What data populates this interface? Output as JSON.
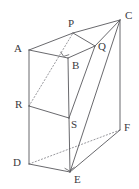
{
  "figure": {
    "type": "geometry-diagram",
    "background_color": "#ffffff",
    "line_color": "#58585c",
    "hidden_line_color": "#8d8d92",
    "label_color": "#3a3a3e",
    "vertices": [
      {
        "id": "A",
        "label": "A",
        "x": 29,
        "y": 50,
        "label_x": 14,
        "label_y": 43
      },
      {
        "id": "P",
        "label": "P",
        "x": 73,
        "y": 33,
        "label_x": 68,
        "label_y": 18
      },
      {
        "id": "C",
        "label": "C",
        "x": 120,
        "y": 20,
        "label_x": 125,
        "label_y": 10
      },
      {
        "id": "Q",
        "label": "Q",
        "x": 95,
        "y": 46,
        "label_x": 98,
        "label_y": 41
      },
      {
        "id": "B",
        "label": "B",
        "x": 68,
        "y": 58,
        "label_x": 72,
        "label_y": 60
      },
      {
        "id": "R",
        "label": "R",
        "x": 29,
        "y": 106,
        "label_x": 15,
        "label_y": 99
      },
      {
        "id": "S",
        "label": "S",
        "x": 69,
        "y": 118,
        "label_x": 71,
        "label_y": 119
      },
      {
        "id": "F",
        "label": "F",
        "x": 120,
        "y": 130,
        "label_x": 124,
        "label_y": 122
      },
      {
        "id": "D",
        "label": "D",
        "x": 29,
        "y": 164,
        "label_x": 13,
        "label_y": 157
      },
      {
        "id": "E",
        "label": "E",
        "x": 70,
        "y": 172,
        "label_x": 74,
        "label_y": 174
      }
    ],
    "solid_edges": [
      {
        "name": "edge-A-P",
        "from": "A",
        "to": "P"
      },
      {
        "name": "edge-P-C",
        "from": "P",
        "to": "C"
      },
      {
        "name": "edge-C-Q",
        "from": "C",
        "to": "Q"
      },
      {
        "name": "edge-P-Q",
        "from": "P",
        "to": "Q"
      },
      {
        "name": "edge-A-B",
        "from": "A",
        "to": "B"
      },
      {
        "name": "edge-Q-B",
        "from": "Q",
        "to": "B"
      },
      {
        "name": "edge-Q-S",
        "from": "Q",
        "to": "S"
      },
      {
        "name": "edge-C-E",
        "from": "C",
        "to": "E"
      },
      {
        "name": "edge-C-F",
        "from": "C",
        "to": "F"
      },
      {
        "name": "edge-A-R",
        "from": "A",
        "to": "R"
      },
      {
        "name": "edge-R-D",
        "from": "R",
        "to": "D"
      },
      {
        "name": "edge-B-S",
        "from": "B",
        "to": "S"
      },
      {
        "name": "edge-S-E",
        "from": "S",
        "to": "E"
      },
      {
        "name": "edge-R-S",
        "from": "R",
        "to": "S"
      },
      {
        "name": "edge-D-E",
        "from": "D",
        "to": "E"
      },
      {
        "name": "edge-E-F",
        "from": "E",
        "to": "F"
      }
    ],
    "hidden_edges": [
      {
        "name": "hidden-edge-R-P",
        "from": "R",
        "to": "P"
      },
      {
        "name": "hidden-edge-D-F",
        "from": "D",
        "to": "F"
      }
    ],
    "right_angle_marks": [
      {
        "name": "right-angle-mark-B",
        "at": "B"
      },
      {
        "name": "right-angle-mark-E",
        "at": "E"
      }
    ]
  }
}
